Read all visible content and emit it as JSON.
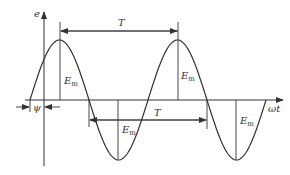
{
  "diagram": {
    "title": "",
    "axes": {
      "y_label": "e",
      "x_label": "ωt"
    },
    "labels": {
      "period_top": "T",
      "period_mid": "T",
      "phase": "ψ",
      "amplitude_main": "E",
      "amplitude_sub": "m"
    },
    "waveform": {
      "type": "sine",
      "zero_start_x": 30,
      "baseline_y": 100,
      "period_px": 118,
      "amplitude_px": 60,
      "cycles": 2
    },
    "colors": {
      "stroke": "#333333",
      "background": "#ffffff"
    }
  }
}
